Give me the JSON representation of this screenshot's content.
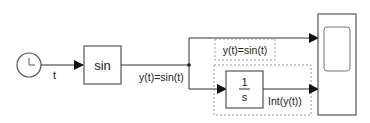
{
  "diagram": {
    "type": "simulink-model",
    "colors": {
      "line": "#333333",
      "block_border": "#555555",
      "dashed": "#999999",
      "background": "#ffffff"
    },
    "blocks": {
      "clock": {
        "name": "Clock",
        "icon": "clock-icon"
      },
      "sin": {
        "label": "sin"
      },
      "integrator": {
        "numerator": "1",
        "denominator": "s"
      },
      "scope": {
        "name": "Scope",
        "icon": "scope-icon"
      }
    },
    "signals": {
      "t": "t",
      "sin_out": "y(t)=sin(t)",
      "annotation_top": "y(t)=sin(t)",
      "integrator_out": "Int(y(t))"
    }
  }
}
